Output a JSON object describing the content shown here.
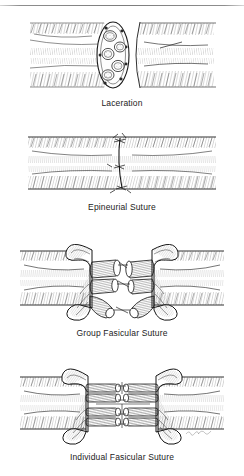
{
  "figure": {
    "background_color": "#ffffff",
    "ink_color": "#1a1a1a",
    "caption_color": "#222222",
    "rule_color": "#7c7c7c",
    "style": "pen-and-ink stipple and hatch medical illustration",
    "signature": "artist signature"
  },
  "panels": [
    {
      "id": "laceration",
      "caption": "Laceration",
      "description": "Severed peripheral nerve trunk shown in cut-away; proximal stump at left displays an oval cross-section of the epineurium containing five rounded nerve fascicles, distal stump at right is retracted with a concave cut face.",
      "elements": {
        "proximal_stump": "proximal nerve stump",
        "distal_stump": "distal nerve stump",
        "cross_section": "nerve cross-section",
        "fascicle_count": 5,
        "epineurium": "epineurium sheath",
        "gap": "laceration gap"
      }
    },
    {
      "id": "epineurial",
      "caption": "Epineurial Suture",
      "description": "Nerve ends coapted and repaired with sutures placed only through the outer epineurium; a single vertical suture line with three knots spans the repair site.",
      "elements": {
        "suture_line": "epineurial suture thread",
        "knot_count": 3,
        "repair_site": "coaptation site",
        "epineurium": "epineurium sheath"
      }
    },
    {
      "id": "group-fascicular",
      "caption": "Group Fasicular Suture",
      "description": "Epineurium incised and curled back in scroll-like flaps on both sides, exposing groups of fascicles that are sutured group to group across the repair.",
      "elements": {
        "epineurial_flap_left": "reflected epineurium flap",
        "epineurial_flap_right": "reflected epineurium flap",
        "fascicle_groups": 4,
        "group_sutures": "group fascicular sutures"
      }
    },
    {
      "id": "individual-fascicular",
      "caption": "Individual Fasicular Suture",
      "description": "Epineurium reflected on both sides; each individual fascicle is separately aligned and sutured end to end in two tiers across the repair site.",
      "elements": {
        "epineurial_flap_left": "reflected epineurium flap",
        "epineurial_flap_right": "reflected epineurium flap",
        "fascicle_tiers": 2,
        "fascicles_per_tier": 3,
        "individual_sutures": "individual fascicular sutures"
      }
    }
  ]
}
